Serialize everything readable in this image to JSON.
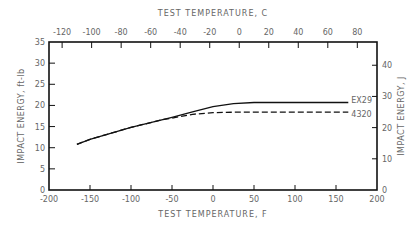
{
  "chart_data": {
    "type": "line",
    "title": "",
    "xlabel": "TEST TEMPERATURE, F",
    "x2label": "TEST TEMPERATURE, C",
    "ylabel": "IMPACT ENERGY, ft-lb",
    "y2label": "IMPACT ENERGY, J",
    "xlim": [
      -200,
      200
    ],
    "ylim": [
      0,
      35
    ],
    "x_ticks": [
      -200,
      -150,
      -100,
      -50,
      0,
      50,
      100,
      150,
      200
    ],
    "x2_ticks": [
      -120,
      -100,
      -80,
      -60,
      -40,
      -20,
      0,
      20,
      40,
      60,
      80
    ],
    "y_ticks": [
      0,
      5,
      10,
      15,
      20,
      25,
      30,
      35
    ],
    "y2_ticks": [
      0,
      10,
      20,
      30,
      40
    ],
    "grid": false,
    "legend_position": "inline-right",
    "series": [
      {
        "name": "EX29",
        "style": "solid",
        "x": [
          -166,
          -150,
          -100,
          -50,
          -25,
          0,
          25,
          50,
          100,
          165
        ],
        "y": [
          10.8,
          12.0,
          14.8,
          17.2,
          18.5,
          19.7,
          20.4,
          20.7,
          20.7,
          20.7
        ]
      },
      {
        "name": "4320",
        "style": "dashed",
        "x": [
          -166,
          -150,
          -100,
          -60,
          -50,
          -25,
          0,
          25,
          100,
          165
        ],
        "y": [
          10.8,
          12.0,
          14.8,
          16.7,
          17.0,
          17.9,
          18.3,
          18.4,
          18.4,
          18.4
        ]
      }
    ]
  }
}
